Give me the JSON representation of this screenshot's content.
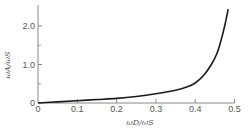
{
  "chart_data": {
    "type": "line",
    "title": "",
    "xlabel": "ωD/ωS",
    "ylabel": "ωA/ωS",
    "xlim": [
      0,
      0.5
    ],
    "ylim": [
      0,
      2.5
    ],
    "grid": false,
    "legend": null,
    "x_ticks": [
      "0",
      "0.1",
      "0.2",
      "0.3",
      "0.4",
      "0.5"
    ],
    "y_ticks": [
      "0",
      "1.0",
      "2.0"
    ],
    "y_minor_ticks": [
      0.5,
      1.5
    ],
    "series": [
      {
        "name": "ωA/ωS",
        "color": "#1a1a1a",
        "x": [
          0,
          0.05,
          0.1,
          0.15,
          0.2,
          0.25,
          0.3,
          0.35,
          0.38,
          0.4,
          0.42,
          0.44,
          0.455,
          0.465,
          0.475,
          0.484
        ],
        "y": [
          0,
          0.03,
          0.06,
          0.09,
          0.12,
          0.17,
          0.24,
          0.33,
          0.42,
          0.52,
          0.7,
          0.98,
          1.28,
          1.6,
          2.0,
          2.44
        ]
      }
    ]
  },
  "colors": {
    "axis": "#888888",
    "curve": "#1a1a1a",
    "text": "#555555"
  }
}
